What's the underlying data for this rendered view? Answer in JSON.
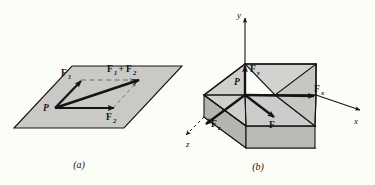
{
  "figure": {
    "background_color": "#fdfdf7",
    "ink_color": "#141414",
    "surface_fill": "#c9c9c6",
    "surface_fill_dark": "#b4b4b0",
    "surface_fill_light": "#d5d5d1",
    "panels": [
      {
        "id": "panel-a",
        "caption": "(a)",
        "description": "Parallelogram law of vector addition in a plane",
        "labels": {
          "origin_point": "P",
          "vector_1": "F",
          "vector_1_sub": "1",
          "vector_2": "F",
          "vector_2_sub": "2",
          "resultant_first": "F",
          "resultant_first_sub": "1",
          "resultant_plus": "+",
          "resultant_second": "F",
          "resultant_second_sub": "2"
        }
      },
      {
        "id": "panel-b",
        "caption": "(b)",
        "description": "Rectangular components of a force vector in three dimensions",
        "labels": {
          "origin_point": "P",
          "axis_x": "x",
          "axis_y": "y",
          "axis_z": "z",
          "component_x": "F",
          "component_x_sub": "x",
          "component_y": "F",
          "component_y_sub": "y",
          "component_z": "F",
          "component_z_sub": "z",
          "resultant": "F"
        }
      }
    ]
  }
}
